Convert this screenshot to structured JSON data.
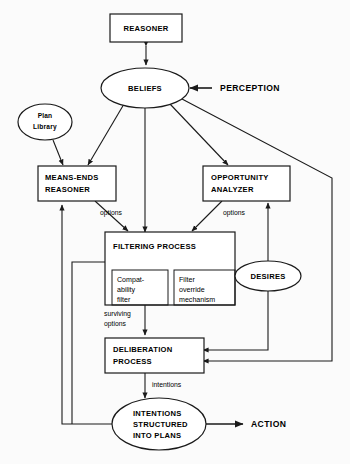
{
  "diagram": {
    "background_color": "#fbfbfb",
    "stroke_color": "#1a1a1a",
    "fill_color": "#ffffff",
    "nodes": {
      "reasoner": {
        "label": "REASONER",
        "shape": "rectangle"
      },
      "beliefs": {
        "label": "BELIEFS",
        "shape": "ellipse"
      },
      "perception": {
        "label": "PERCEPTION",
        "shape": "text"
      },
      "plan_library": {
        "line1": "Plan",
        "line2": "Library",
        "shape": "ellipse"
      },
      "means_ends": {
        "line1": "MEANS-ENDS",
        "line2": "REASONER",
        "shape": "rectangle"
      },
      "opportunity": {
        "line1": "OPPORTUNITY",
        "line2": "ANALYZER",
        "shape": "rectangle"
      },
      "filtering": {
        "label": "FILTERING PROCESS",
        "shape": "rectangle"
      },
      "compatability": {
        "line1": "Compat-",
        "line2": "ability",
        "line3": "filter",
        "shape": "rectangle"
      },
      "filter_override": {
        "line1": "Filter",
        "line2": "override",
        "line3": "mechanism",
        "shape": "rectangle"
      },
      "desires": {
        "label": "DESIRES",
        "shape": "ellipse"
      },
      "deliberation": {
        "line1": "DELIBERATION",
        "line2": "PROCESS",
        "shape": "rectangle"
      },
      "intentions": {
        "line1": "INTENTIONS",
        "line2": "STRUCTURED",
        "line3": "INTO PLANS",
        "shape": "ellipse"
      },
      "action": {
        "label": "ACTION",
        "shape": "text"
      }
    },
    "edge_labels": {
      "options_left": "options",
      "options_right": "options",
      "surviving_line1": "surviving",
      "surviving_line2": "options",
      "intentions_edge": "intentions"
    }
  }
}
